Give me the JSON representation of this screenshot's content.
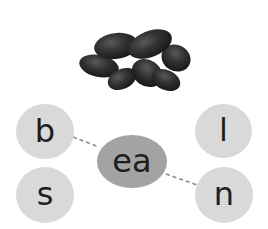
{
  "image": {
    "subject": "kidney beans",
    "icon": "beans-illustration-icon"
  },
  "activity": {
    "center_vowel": "ea",
    "left_letters": [
      "b",
      "s"
    ],
    "right_letters": [
      "l",
      "n"
    ],
    "connections": [
      {
        "from": "b",
        "to": "ea"
      },
      {
        "from": "ea",
        "to": "n"
      }
    ],
    "answer_word": "bean"
  },
  "colors": {
    "letter_bubble": "#d9d9d9",
    "vowel_bubble": "#a3a3a3",
    "text": "#1e1e1e",
    "connector": "#8a8a8a",
    "bean": "#2a2a2a"
  }
}
